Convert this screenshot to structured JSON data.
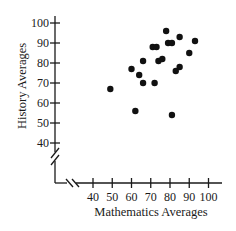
{
  "chart_data": {
    "type": "scatter",
    "title": "",
    "xlabel": "Mathematics Averages",
    "ylabel": "History Averages",
    "xlim": [
      40,
      100
    ],
    "ylim": [
      40,
      100
    ],
    "x_ticks": [
      40,
      50,
      60,
      70,
      80,
      90,
      100
    ],
    "y_ticks": [
      40,
      50,
      60,
      70,
      80,
      90,
      100
    ],
    "axis_breaks": {
      "x": true,
      "y": true
    },
    "grid": false,
    "legend": null,
    "marker_color": "#111111",
    "points": [
      {
        "x": 78,
        "y": 96
      },
      {
        "x": 85,
        "y": 93
      },
      {
        "x": 93,
        "y": 91
      },
      {
        "x": 79,
        "y": 90
      },
      {
        "x": 81,
        "y": 90
      },
      {
        "x": 71,
        "y": 88
      },
      {
        "x": 73,
        "y": 88
      },
      {
        "x": 90,
        "y": 85
      },
      {
        "x": 66,
        "y": 81
      },
      {
        "x": 74,
        "y": 81
      },
      {
        "x": 76,
        "y": 82
      },
      {
        "x": 60,
        "y": 77
      },
      {
        "x": 85,
        "y": 78
      },
      {
        "x": 83,
        "y": 76
      },
      {
        "x": 64,
        "y": 74
      },
      {
        "x": 66,
        "y": 70
      },
      {
        "x": 72,
        "y": 70
      },
      {
        "x": 49,
        "y": 67
      },
      {
        "x": 62,
        "y": 56
      },
      {
        "x": 81,
        "y": 54
      }
    ]
  }
}
